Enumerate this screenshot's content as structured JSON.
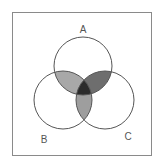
{
  "diagram": {
    "type": "venn",
    "sets": [
      {
        "id": "A",
        "label": "A",
        "cx": 83,
        "cy": 66,
        "r": 29
      },
      {
        "id": "B",
        "label": "B",
        "cx": 63,
        "cy": 100,
        "r": 29
      },
      {
        "id": "C",
        "label": "C",
        "cx": 105,
        "cy": 100,
        "r": 29
      }
    ],
    "labels": {
      "a": "A",
      "b": "B",
      "c": "C"
    },
    "regions": {
      "a_and_b": {
        "fill": "#a8a8a8"
      },
      "a_and_c": {
        "fill": "#6e6e6e"
      },
      "b_and_c": {
        "fill": "#9e9e9e"
      },
      "a_and_b_and_c": {
        "fill": "#2b2b2b"
      }
    },
    "stroke": "#555555",
    "frame_color": "#8a8a8a"
  }
}
